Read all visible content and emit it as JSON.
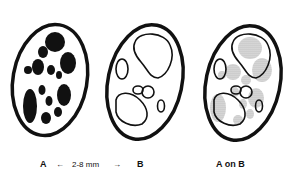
{
  "figure": {
    "panels": [
      {
        "id": "A",
        "label": "A",
        "description": "ellipse with solid black spots"
      },
      {
        "id": "B",
        "label": "B",
        "description": "ellipse with outlined shapes"
      },
      {
        "id": "AonB",
        "label": "A on B",
        "description": "outlines overlaid on stippled spots"
      }
    ],
    "scale": {
      "text": "2-8 mm",
      "left_arrow": "←",
      "right_arrow": "→"
    },
    "colors": {
      "ink": "#111111",
      "stipple": "#b8b8b8",
      "background": "#ffffff"
    }
  }
}
